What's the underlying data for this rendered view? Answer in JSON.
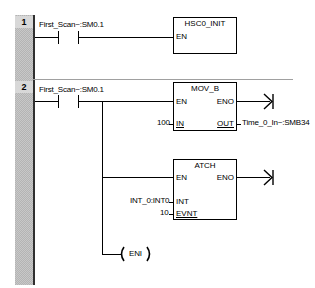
{
  "networks": [
    {
      "number": "1",
      "contact": {
        "label": "First_Scan~:SM0.1"
      },
      "box": {
        "title": "HSC0_INIT",
        "pins_left": [
          "EN"
        ]
      }
    },
    {
      "number": "2",
      "contact": {
        "label": "First_Scan~:SM0.1"
      },
      "mov_box": {
        "title": "MOV_B",
        "en": "EN",
        "eno": "ENO",
        "in_pin": "IN",
        "out_pin": "OUT",
        "in_value": "100",
        "out_value": "Time_0_In~:SMB34"
      },
      "atch_box": {
        "title": "ATCH",
        "en": "EN",
        "eno": "ENO",
        "int_pin": "INT",
        "evnt_pin": "EVNT",
        "int_value": "INT_0:INT0",
        "evnt_value": "10"
      },
      "coil": {
        "label": "ENI"
      }
    }
  ]
}
